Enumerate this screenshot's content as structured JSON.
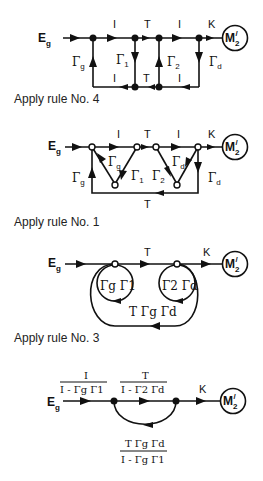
{
  "figure": {
    "source_label": "E",
    "source_sub": "g",
    "sink_label": "M",
    "sink_sub": "2",
    "sink_prime": "/",
    "gamma": "Γ",
    "sub_g": "g",
    "sub_1": "1",
    "sub_2": "2",
    "sub_d": "d"
  },
  "stage1": {
    "top_labels": [
      "I",
      "T",
      "I",
      "K"
    ],
    "bottom_labels": [
      "I",
      "T",
      "I"
    ],
    "caption": "Apply rule No. 4"
  },
  "stage2": {
    "top_labels": [
      "I",
      "T",
      "I",
      "K"
    ],
    "bottom_label": "T",
    "caption": "Apply rule No. 1"
  },
  "stage3": {
    "top_labels": [
      "T",
      "K"
    ],
    "loop1": "Γg Γ1",
    "loop2": "Γ2 Γd",
    "feedback": "T Γg Γd",
    "caption": "Apply rule No. 3"
  },
  "stage4": {
    "branch1_num": "I",
    "branch1_den": "I - Γg Γ1",
    "branch2_num": "T",
    "branch2_den": "I - Γ2 Γd",
    "k_label": "K",
    "feedback_num": "T Γg Γd",
    "feedback_den": "I - Γg Γ1"
  }
}
